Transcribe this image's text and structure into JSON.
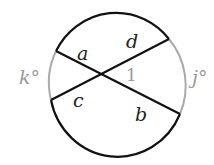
{
  "diagram": {
    "type": "circle with two intersecting chords",
    "colors": {
      "dark_arc": "#111111",
      "light_arc": "#a8a8a8",
      "chord": "#111111",
      "label_dark": "#222222",
      "label_light": "#9a9a9a"
    },
    "arcs": [
      {
        "name": "left-arc",
        "label": "k°"
      },
      {
        "name": "right-arc",
        "label": "j°"
      }
    ],
    "labels": {
      "a": "a",
      "b": "b",
      "c": "c",
      "d": "d",
      "angle1": "1",
      "k": "k°",
      "j": "j°"
    }
  }
}
